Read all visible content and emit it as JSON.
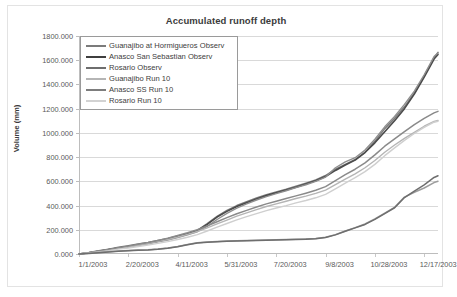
{
  "chart_data": {
    "type": "line",
    "title": "Accumulated runoff depth",
    "xlabel": "",
    "ylabel": "Volume (mm)",
    "ylim": [
      0,
      1800
    ],
    "ytick_step": 200,
    "ytick_labels": [
      "0.000",
      "200.000",
      "400.000",
      "600.000",
      "800.000",
      "1000.000",
      "1200.000",
      "1400.000",
      "1600.000",
      "1800.000"
    ],
    "ytick_values": [
      0,
      200,
      400,
      600,
      800,
      1000,
      1200,
      1400,
      1600,
      1800
    ],
    "xtick_labels": [
      "1/1/2003",
      "2/20/2003",
      "4/11/2003",
      "5/31/2003",
      "7/20/2003",
      "9/8/2003",
      "10/28/2003",
      "12/17/2003"
    ],
    "xtick_values": [
      0,
      50,
      100,
      150,
      200,
      250,
      300,
      350
    ],
    "xlim": [
      0,
      364
    ],
    "grid": "horizontal",
    "legend_position": "top-left-inside",
    "x": [
      0,
      10,
      20,
      30,
      40,
      50,
      60,
      70,
      80,
      90,
      100,
      110,
      120,
      130,
      140,
      150,
      160,
      170,
      180,
      190,
      200,
      210,
      220,
      230,
      240,
      250,
      260,
      270,
      280,
      290,
      300,
      310,
      320,
      330,
      340,
      350,
      360,
      364
    ],
    "series": [
      {
        "name": "Guanajibo at Hormigueros Observ",
        "color": "#7b7b7b",
        "width": 1.5,
        "values": [
          0,
          12,
          26,
          40,
          55,
          68,
          82,
          96,
          112,
          128,
          148,
          168,
          196,
          250,
          310,
          360,
          400,
          432,
          462,
          490,
          512,
          535,
          560,
          585,
          612,
          648,
          700,
          740,
          780,
          840,
          930,
          1035,
          1120,
          1215,
          1330,
          1470,
          1620,
          1665
        ]
      },
      {
        "name": "Anasco San Sebastian Observ",
        "color": "#4a4a4a",
        "width": 1.6,
        "values": [
          0,
          10,
          22,
          36,
          50,
          62,
          76,
          90,
          106,
          124,
          144,
          166,
          192,
          245,
          305,
          352,
          392,
          424,
          455,
          482,
          505,
          528,
          552,
          578,
          605,
          640,
          690,
          735,
          775,
          838,
          918,
          1010,
          1100,
          1200,
          1320,
          1460,
          1610,
          1648
        ]
      },
      {
        "name": "Rosario Observ",
        "color": "#8f8f8f",
        "width": 1.4,
        "values": [
          0,
          9,
          20,
          32,
          46,
          58,
          70,
          84,
          100,
          116,
          136,
          158,
          184,
          228,
          285,
          336,
          378,
          414,
          446,
          474,
          498,
          522,
          548,
          572,
          600,
          635,
          712,
          760,
          795,
          858,
          948,
          1050,
          1135,
          1235,
          1345,
          1480,
          1630,
          1660
        ]
      },
      {
        "name": "Guanajibo Run 10",
        "color": "#b5b5b5",
        "width": 1.4,
        "values": [
          0,
          10,
          22,
          34,
          48,
          60,
          74,
          88,
          104,
          120,
          140,
          162,
          186,
          215,
          248,
          280,
          312,
          340,
          366,
          392,
          414,
          436,
          458,
          478,
          500,
          528,
          572,
          618,
          662,
          712,
          772,
          840,
          900,
          955,
          1005,
          1055,
          1095,
          1102
        ]
      },
      {
        "name": "Anasco SS Run 10",
        "color": "#8a8a8a",
        "width": 1.5,
        "values": [
          0,
          11,
          24,
          37,
          52,
          65,
          80,
          95,
          112,
          130,
          152,
          175,
          200,
          232,
          266,
          300,
          332,
          360,
          388,
          414,
          436,
          458,
          480,
          502,
          526,
          556,
          605,
          655,
          700,
          752,
          818,
          890,
          950,
          1010,
          1068,
          1120,
          1165,
          1178
        ]
      },
      {
        "name": "Rosario Run 10",
        "color": "#cfcfcf",
        "width": 1.4,
        "values": [
          0,
          8,
          18,
          28,
          40,
          50,
          62,
          74,
          88,
          102,
          120,
          138,
          160,
          190,
          222,
          252,
          282,
          308,
          334,
          358,
          380,
          400,
          422,
          442,
          464,
          492,
          538,
          586,
          630,
          680,
          740,
          812,
          876,
          938,
          995,
          1045,
          1088,
          1096
        ]
      },
      {
        "name": "Guanajibo low",
        "color": "#9d9d9d",
        "width": 1.5,
        "legend": false,
        "values": [
          0,
          6,
          12,
          18,
          24,
          28,
          32,
          36,
          42,
          50,
          62,
          78,
          92,
          100,
          104,
          108,
          110,
          112,
          114,
          116,
          118,
          120,
          122,
          124,
          128,
          138,
          160,
          190,
          218,
          248,
          290,
          338,
          385,
          470,
          510,
          545,
          590,
          600
        ]
      },
      {
        "name": "Anasco low",
        "color": "#6e6e6e",
        "width": 1.5,
        "legend": false,
        "values": [
          0,
          5,
          11,
          17,
          22,
          26,
          30,
          34,
          40,
          48,
          60,
          76,
          90,
          98,
          102,
          105,
          107,
          109,
          111,
          113,
          115,
          117,
          119,
          122,
          126,
          136,
          158,
          188,
          216,
          244,
          286,
          334,
          382,
          466,
          520,
          570,
          632,
          646
        ]
      }
    ]
  },
  "legend": {
    "items": [
      {
        "label": "Guanajibo at Hormigueros Observ",
        "color": "#7b7b7b",
        "width": 2.4
      },
      {
        "label": "Anasco San Sebastian Observ",
        "color": "#3f3f3f",
        "width": 2.6
      },
      {
        "label": "Rosario Observ",
        "color": "#6e6e6e",
        "width": 2.4
      },
      {
        "label": "Guanajibo Run 10",
        "color": "#b5b5b5",
        "width": 2.0
      },
      {
        "label": "Anasco SS Run 10",
        "color": "#7d7d7d",
        "width": 2.4
      },
      {
        "label": "Rosario Run 10",
        "color": "#d2d2d2",
        "width": 2.0
      }
    ]
  },
  "colors": {
    "background": "#ffffff",
    "frame_border": "#e3e3e3",
    "gridline": "#d9d9d9",
    "axis": "#bdbdbd",
    "text": "#5a5a5a",
    "title_text": "#3b3b3b"
  }
}
